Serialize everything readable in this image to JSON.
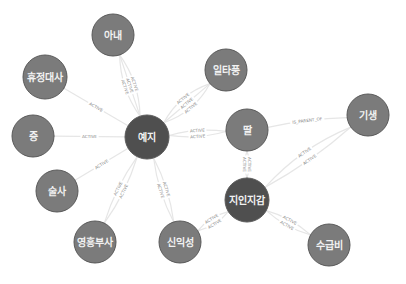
{
  "graph": {
    "colors": {
      "node_default": "#7b7b7b",
      "node_hub": "#4f4f4f",
      "edge": "#e6e6e6",
      "edge_label": "#888888",
      "node_text": "#f2f2f2"
    },
    "nodes": [
      {
        "id": "anae",
        "label": "아내",
        "x": 113,
        "y": 35,
        "r": 21,
        "hub": false
      },
      {
        "id": "hyujeong",
        "label": "휴정대사",
        "x": 45,
        "y": 77,
        "r": 22,
        "hub": false
      },
      {
        "id": "iltapung",
        "label": "일타풍",
        "x": 226,
        "y": 70,
        "r": 21,
        "hub": false
      },
      {
        "id": "jeung",
        "label": "증",
        "x": 33,
        "y": 136,
        "r": 21,
        "hub": false
      },
      {
        "id": "yeji",
        "label": "예지",
        "x": 147,
        "y": 137,
        "r": 22,
        "hub": true
      },
      {
        "id": "ttal",
        "label": "딸",
        "x": 247,
        "y": 130,
        "r": 21,
        "hub": false
      },
      {
        "id": "gisaeng",
        "label": "기생",
        "x": 368,
        "y": 115,
        "r": 21,
        "hub": false
      },
      {
        "id": "sulsa",
        "label": "술사",
        "x": 57,
        "y": 191,
        "r": 21,
        "hub": false
      },
      {
        "id": "jiin",
        "label": "지인지감",
        "x": 247,
        "y": 200,
        "r": 22,
        "hub": true
      },
      {
        "id": "yeongheung",
        "label": "영흥부사",
        "x": 95,
        "y": 242,
        "r": 21,
        "hub": false
      },
      {
        "id": "sinikseong",
        "label": "신익성",
        "x": 180,
        "y": 242,
        "r": 21,
        "hub": false
      },
      {
        "id": "sugeupbi",
        "label": "수급비",
        "x": 329,
        "y": 245,
        "r": 21,
        "hub": false
      }
    ],
    "edges": [
      {
        "from": "yeji",
        "to": "anae",
        "label": "ACTIVE",
        "bend": -10
      },
      {
        "from": "yeji",
        "to": "anae",
        "label": "ACTIVE",
        "bend": 0
      },
      {
        "from": "yeji",
        "to": "anae",
        "label": "ACTIVE",
        "bend": 10
      },
      {
        "from": "yeji",
        "to": "iltapung",
        "label": "ACTIVE",
        "bend": -12
      },
      {
        "from": "yeji",
        "to": "iltapung",
        "label": "ACTIVE",
        "bend": 0
      },
      {
        "from": "yeji",
        "to": "iltapung",
        "label": "ACTIVE",
        "bend": 12
      },
      {
        "from": "yeji",
        "to": "hyujeong",
        "label": "ACTIVE",
        "bend": 0
      },
      {
        "from": "yeji",
        "to": "jeung",
        "label": "ACTIVE",
        "bend": 0
      },
      {
        "from": "yeji",
        "to": "sulsa",
        "label": "ACTIVE",
        "bend": 0
      },
      {
        "from": "yeji",
        "to": "ttal",
        "label": "ACTIVE",
        "bend": -6
      },
      {
        "from": "yeji",
        "to": "ttal",
        "label": "ACTIVE",
        "bend": 6
      },
      {
        "from": "yeji",
        "to": "yeongheung",
        "label": "ACTIVE",
        "bend": -6
      },
      {
        "from": "yeji",
        "to": "yeongheung",
        "label": "ACTIVE",
        "bend": 6
      },
      {
        "from": "yeji",
        "to": "sinikseong",
        "label": "ACTIVE",
        "bend": -6
      },
      {
        "from": "yeji",
        "to": "sinikseong",
        "label": "ACTIVE",
        "bend": 6
      },
      {
        "from": "ttal",
        "to": "gisaeng",
        "label": "IS_PARENT_OF",
        "bend": -4
      },
      {
        "from": "ttal",
        "to": "jiin",
        "label": "ACTIVE",
        "bend": -5
      },
      {
        "from": "ttal",
        "to": "jiin",
        "label": "ACTIVE",
        "bend": 5
      },
      {
        "from": "jiin",
        "to": "gisaeng",
        "label": "ACTIVE",
        "bend": -12
      },
      {
        "from": "jiin",
        "to": "gisaeng",
        "label": "ACTIVE",
        "bend": 6
      },
      {
        "from": "jiin",
        "to": "sinikseong",
        "label": "ACTIVE",
        "bend": -6
      },
      {
        "from": "jiin",
        "to": "sinikseong",
        "label": "ACTIVE",
        "bend": 6
      },
      {
        "from": "jiin",
        "to": "sugeupbi",
        "label": "ACTIVE",
        "bend": -6
      },
      {
        "from": "jiin",
        "to": "sugeupbi",
        "label": "ACTIVE",
        "bend": 6
      }
    ]
  }
}
